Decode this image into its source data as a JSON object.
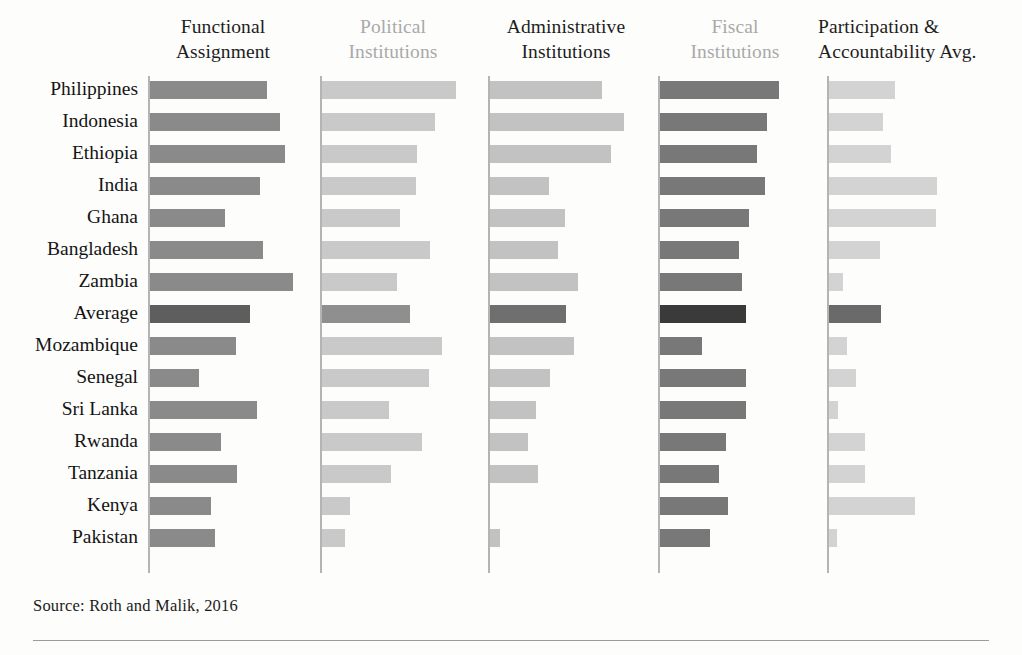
{
  "source_note": "Source: Roth and Malik, 2016",
  "colors": {
    "header_dark": "#1d1d1d",
    "header_light": "#a9a9a9",
    "axis": "#b4b4b4",
    "rule": "#9b9b9b",
    "background": "#fdfdfc",
    "series_functional_assignment": "#8a8a8a",
    "series_political_institutions": "#c9c9c9",
    "series_administrative_institutions": "#c2c2c2",
    "series_fiscal_institutions": "#787878",
    "series_participation_accountability": "#d3d3d3",
    "average_functional_assignment": "#5e5e5e",
    "average_political_institutions": "#8f8f8f",
    "average_administrative_institutions": "#6f6f6f",
    "average_fiscal_institutions": "#3a3a3a",
    "average_participation_accountability": "#6a6a6a"
  },
  "chart_data": {
    "type": "bar",
    "orientation": "horizontal",
    "title": "",
    "subtitle": "",
    "xlabel": "",
    "ylabel": "",
    "grid": false,
    "legend": "none",
    "layout": "small-multiples, 5 panels sharing one category axis",
    "xlim": [
      0,
      1.15
    ],
    "highlight_category": "Average",
    "categories": [
      "Philippines",
      "Indonesia",
      "Ethiopia",
      "India",
      "Ghana",
      "Bangladesh",
      "Zambia",
      "Average",
      "Mozambique",
      "Senegal",
      "Sri Lanka",
      "Rwanda",
      "Tanzania",
      "Kenya",
      "Pakistan"
    ],
    "series": [
      {
        "name": "Functional Assignment",
        "header_style": "dark",
        "values": [
          0.9,
          1.0,
          1.04,
          0.85,
          0.58,
          0.87,
          1.1,
          0.77,
          0.66,
          0.38,
          0.82,
          0.55,
          0.67,
          0.47,
          0.5
        ]
      },
      {
        "name": "Political Institutions",
        "header_style": "light",
        "values": [
          1.03,
          0.87,
          0.73,
          0.72,
          0.6,
          0.83,
          0.58,
          0.68,
          0.92,
          0.82,
          0.52,
          0.77,
          0.53,
          0.22,
          0.18
        ]
      },
      {
        "name": "Administrative Institutions",
        "header_style": "dark",
        "values": [
          0.85,
          1.02,
          0.92,
          0.45,
          0.57,
          0.52,
          0.67,
          0.58,
          0.64,
          0.46,
          0.35,
          0.29,
          0.37,
          0.0,
          0.08
        ]
      },
      {
        "name": "Fiscal Institutions",
        "header_style": "light",
        "values": [
          0.9,
          0.81,
          0.74,
          0.8,
          0.68,
          0.6,
          0.62,
          0.65,
          0.32,
          0.65,
          0.65,
          0.5,
          0.45,
          0.52,
          0.38
        ]
      },
      {
        "name": "Participation & Accountability Avg.",
        "header_style": "dark",
        "values": [
          0.48,
          0.39,
          0.45,
          0.78,
          0.77,
          0.37,
          0.1,
          0.38,
          0.13,
          0.2,
          0.07,
          0.26,
          0.26,
          0.62,
          0.06
        ]
      }
    ]
  },
  "headers": {
    "col1_line1": "Functional",
    "col1_line2": "Assignment",
    "col2_line1": "Political",
    "col2_line2": "Institutions",
    "col3_line1": "Administrative",
    "col3_line2": "Institutions",
    "col4_line1": "Fiscal",
    "col4_line2": "Institutions",
    "col5_line1": "Participation &",
    "col5_line2": "Accountability Avg."
  }
}
